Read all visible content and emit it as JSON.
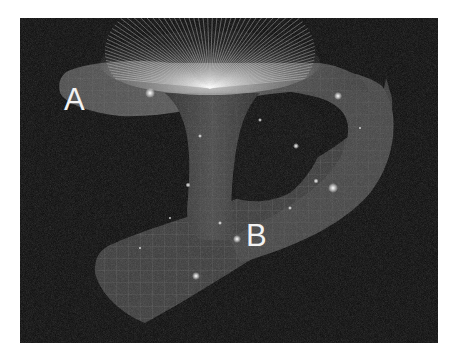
{
  "figure": {
    "labels": {
      "point_a": "A",
      "point_b": "B"
    },
    "colors": {
      "background": "#0c0c0c",
      "surface": "#4a4a4a",
      "grid": "#9a9a9a",
      "glow": "#ffffff",
      "page": "#ffffff"
    }
  }
}
